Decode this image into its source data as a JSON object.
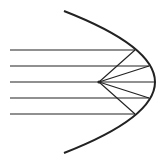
{
  "diagram": {
    "type": "parabolic-reflector",
    "width": 163,
    "height": 162,
    "colors": {
      "stroke": "#222222",
      "background": "#ffffff"
    },
    "parabola": {
      "path": "M64,11 Q246,82 64,153",
      "stroke_width": 2
    },
    "focus": {
      "x": 99,
      "y": 82
    },
    "rays": [
      {
        "y": 50,
        "x_start": 10,
        "x_end": 135
      },
      {
        "y": 66,
        "x_start": 10,
        "x_end": 149
      },
      {
        "y": 82,
        "x_start": 10,
        "x_end": 155
      },
      {
        "y": 98,
        "x_start": 10,
        "x_end": 149
      },
      {
        "y": 114,
        "x_start": 10,
        "x_end": 135
      }
    ]
  }
}
